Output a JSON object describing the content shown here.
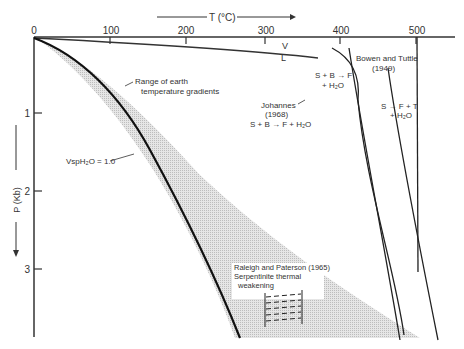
{
  "figure": {
    "x_axis": {
      "label": "T (°C)",
      "ticks": [
        "0",
        "100",
        "200",
        "300",
        "400",
        "500"
      ]
    },
    "y_axis": {
      "label": "P (Kb)",
      "ticks": [
        "1",
        "2",
        "3"
      ]
    },
    "annotations": {
      "vl_upper": "V",
      "vl_lower": "L",
      "range": [
        "Range of earth",
        "temperature gradients"
      ],
      "vsp": "VspH₂O = 1.0",
      "johannes": [
        "Johannes",
        "(1968)",
        "S + B → F + H₂O"
      ],
      "bowen": [
        "Bowen and Tuttle",
        "(1949)"
      ],
      "sbf": [
        "S + B → F",
        "+ H₂O"
      ],
      "sft": [
        "S → F + T",
        "+ H₂O"
      ],
      "raleigh": [
        "Raleigh and Paterson (1965)",
        "Serpentinite thermal",
        "weakening"
      ]
    }
  }
}
